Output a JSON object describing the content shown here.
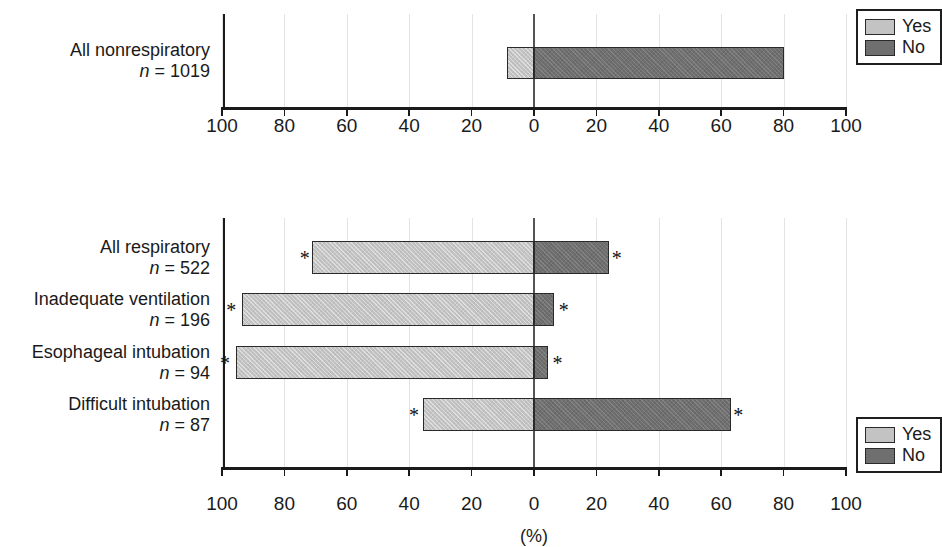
{
  "chart_data": [
    {
      "type": "bar",
      "id": "nonrespiratory",
      "orientation": "horizontal",
      "layout": "diverging",
      "title": "",
      "xlabel": "",
      "ylabel": "",
      "xlim": [
        -100,
        100
      ],
      "xticks": [
        -100,
        -80,
        -60,
        -40,
        -20,
        0,
        20,
        40,
        60,
        80,
        100
      ],
      "xticklabels": [
        "100",
        "80",
        "60",
        "40",
        "20",
        "0",
        "20",
        "40",
        "60",
        "80",
        "100"
      ],
      "grid": true,
      "legend": {
        "position": "top-right",
        "entries": [
          {
            "label": "Yes",
            "color": "#c3c3c3"
          },
          {
            "label": "No",
            "color": "#6f6f6f"
          }
        ]
      },
      "categories": [
        "All nonrespiratory"
      ],
      "category_n": [
        "1019"
      ],
      "series": [
        {
          "name": "Yes",
          "color": "#c3c3c3",
          "values": [
            8.6
          ],
          "direction": "left"
        },
        {
          "name": "No",
          "color": "#6f6f6f",
          "values": [
            80.0
          ],
          "direction": "right"
        }
      ],
      "significance_markers": []
    },
    {
      "type": "bar",
      "id": "respiratory",
      "orientation": "horizontal",
      "layout": "diverging",
      "title": "",
      "xlabel": "(%)",
      "ylabel": "",
      "xlim": [
        -100,
        100
      ],
      "xticks": [
        -100,
        -80,
        -60,
        -40,
        -20,
        0,
        20,
        40,
        60,
        80,
        100
      ],
      "xticklabels": [
        "100",
        "80",
        "60",
        "40",
        "20",
        "0",
        "20",
        "40",
        "60",
        "80",
        "100"
      ],
      "grid": true,
      "legend": {
        "position": "top-right",
        "entries": [
          {
            "label": "Yes",
            "color": "#c3c3c3"
          },
          {
            "label": "No",
            "color": "#6f6f6f"
          }
        ]
      },
      "categories": [
        "All respiratory",
        "Inadequate ventilation",
        "Esophageal intubation",
        "Difficult intubation"
      ],
      "category_n": [
        "522",
        "196",
        "94",
        "87"
      ],
      "series": [
        {
          "name": "Yes",
          "color": "#c3c3c3",
          "values": [
            71.0,
            93.5,
            95.5,
            35.5
          ],
          "direction": "left"
        },
        {
          "name": "No",
          "color": "#6f6f6f",
          "values": [
            24.0,
            6.5,
            4.5,
            63.0
          ],
          "direction": "right"
        }
      ],
      "significance_markers": [
        {
          "category": "All respiratory",
          "side": "left",
          "value": 73.5,
          "symbol": "*"
        },
        {
          "category": "All respiratory",
          "side": "right",
          "value": 26.5,
          "symbol": "*"
        },
        {
          "category": "Inadequate ventilation",
          "side": "left",
          "value": 97.0,
          "symbol": "*"
        },
        {
          "category": "Inadequate ventilation",
          "side": "right",
          "value": 9.5,
          "symbol": "*"
        },
        {
          "category": "Esophageal intubation",
          "side": "left",
          "value": 99.0,
          "symbol": "*"
        },
        {
          "category": "Esophageal intubation",
          "side": "right",
          "value": 7.5,
          "symbol": "*"
        },
        {
          "category": "Difficult intubation",
          "side": "left",
          "value": 38.5,
          "symbol": "*"
        },
        {
          "category": "Difficult intubation",
          "side": "right",
          "value": 65.5,
          "symbol": "*"
        }
      ]
    }
  ],
  "top_chart": {
    "rows": [
      {
        "name": "All nonrespiratory",
        "n_prefix": "n",
        "n_eq": " = ",
        "n_value": "1019"
      }
    ],
    "ticklabels": [
      "100",
      "80",
      "60",
      "40",
      "20",
      "0",
      "20",
      "40",
      "60",
      "80",
      "100"
    ],
    "legend": {
      "yes_label": "Yes",
      "no_label": "No"
    }
  },
  "bottom_chart": {
    "rows": [
      {
        "name": "All respiratory",
        "n_prefix": "n",
        "n_eq": " = ",
        "n_value": "522"
      },
      {
        "name": "Inadequate ventilation",
        "n_prefix": "n",
        "n_eq": " = ",
        "n_value": "196"
      },
      {
        "name": "Esophageal intubation",
        "n_prefix": "n",
        "n_eq": " = ",
        "n_value": "94"
      },
      {
        "name": "Difficult intubation",
        "n_prefix": "n",
        "n_eq": " = ",
        "n_value": "87"
      }
    ],
    "ticklabels": [
      "100",
      "80",
      "60",
      "40",
      "20",
      "0",
      "20",
      "40",
      "60",
      "80",
      "100"
    ],
    "axis_title": "(%)",
    "legend": {
      "yes_label": "Yes",
      "no_label": "No"
    },
    "star_symbol": "*"
  },
  "colors": {
    "yes": "#c3c3c3",
    "no": "#6f6f6f",
    "axis": "#1a1a1a",
    "grid": "#e3e3e3"
  }
}
